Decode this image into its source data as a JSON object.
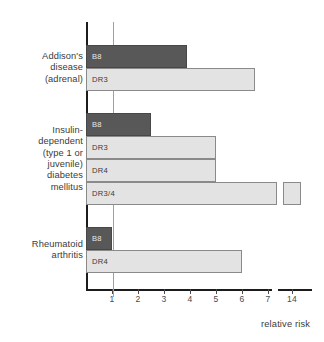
{
  "chart_data": {
    "type": "bar",
    "orientation": "horizontal",
    "title": "",
    "xlabel": "relative risk",
    "ylabel": "",
    "xlim": [
      0,
      7.6
    ],
    "grid": false,
    "legend": null,
    "reference_line": 1,
    "broken_axis": {
      "break_after": 7.5,
      "resume_label": "14"
    },
    "tick_labels": [
      "1",
      "2",
      "3",
      "4",
      "5",
      "6",
      "7",
      "14"
    ],
    "tick_values": [
      1,
      2,
      3,
      4,
      5,
      6,
      7,
      14
    ],
    "groups": [
      {
        "name": "Addison's\ndisease\n(adrenal)",
        "label_lines": [
          "Addison's",
          "disease",
          "(adrenal)"
        ],
        "bars": [
          {
            "allele": "B8",
            "value": 3.9,
            "shade": "dark"
          },
          {
            "allele": "DR3",
            "value": 6.5,
            "shade": "light"
          }
        ]
      },
      {
        "name": "Insulin-dependent (type 1 or juvenile) diabetes mellitus",
        "label_lines": [
          "Insulin-",
          "dependent",
          "(type 1 or",
          "juvenile)",
          "diabetes",
          "mellitus"
        ],
        "bars": [
          {
            "allele": "B8",
            "value": 2.5,
            "shade": "dark"
          },
          {
            "allele": "DR3",
            "value": 5.0,
            "shade": "light"
          },
          {
            "allele": "DR4",
            "value": 5.0,
            "shade": "light"
          },
          {
            "allele": "DR3/4",
            "value": 14.0,
            "shade": "light",
            "broken": true
          }
        ]
      },
      {
        "name": "Rheumatoid arthritis",
        "label_lines": [
          "Rheumatoid",
          "arthritis"
        ],
        "bars": [
          {
            "allele": "B8",
            "value": 1.0,
            "shade": "dark"
          },
          {
            "allele": "DR4",
            "value": 6.0,
            "shade": "light"
          }
        ]
      }
    ],
    "colors": {
      "dark_bar": "#585858",
      "light_bar": "#e3e3e3",
      "bar_outline": "#8a8a8a",
      "axis": "#1c1c1c",
      "reference_line": "#9aa0b4",
      "text": "#3a3a3a"
    }
  }
}
